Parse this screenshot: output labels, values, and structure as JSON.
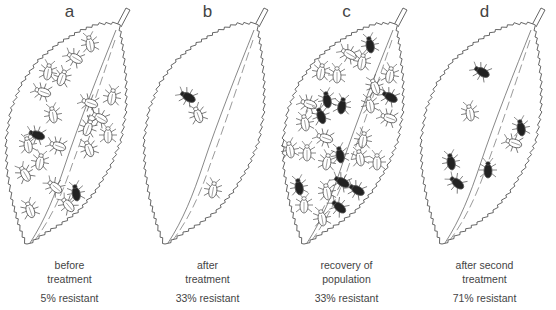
{
  "figure": {
    "colors": {
      "line": "#555555",
      "susceptible_fill": "#ffffff",
      "resistant_fill": "#222222",
      "text": "#444444"
    },
    "legend_semantics": {
      "white_insect": "susceptible",
      "black_insect": "resistant"
    },
    "panels": [
      {
        "letter": "a",
        "caption_line1": "before",
        "caption_line2": "treatment",
        "resistant_label": "5% resistant",
        "resistant_percent": 5,
        "insects": [
          {
            "x": 90,
            "y": 44,
            "r": -10,
            "res": false
          },
          {
            "x": 75,
            "y": 58,
            "r": -60,
            "res": false
          },
          {
            "x": 48,
            "y": 72,
            "r": 10,
            "res": false
          },
          {
            "x": 62,
            "y": 78,
            "r": 20,
            "res": false
          },
          {
            "x": 43,
            "y": 92,
            "r": -70,
            "res": false
          },
          {
            "x": 53,
            "y": 115,
            "r": -10,
            "res": false
          },
          {
            "x": 112,
            "y": 97,
            "r": 10,
            "res": false
          },
          {
            "x": 90,
            "y": 103,
            "r": -70,
            "res": false
          },
          {
            "x": 100,
            "y": 118,
            "r": -60,
            "res": false
          },
          {
            "x": 88,
            "y": 128,
            "r": 20,
            "res": false
          },
          {
            "x": 108,
            "y": 135,
            "r": 0,
            "res": false
          },
          {
            "x": 89,
            "y": 149,
            "r": -20,
            "res": false
          },
          {
            "x": 37,
            "y": 135,
            "r": -70,
            "res": true
          },
          {
            "x": 28,
            "y": 145,
            "r": -10,
            "res": false
          },
          {
            "x": 58,
            "y": 146,
            "r": -70,
            "res": false
          },
          {
            "x": 40,
            "y": 162,
            "r": 10,
            "res": false
          },
          {
            "x": 25,
            "y": 174,
            "r": -30,
            "res": false
          },
          {
            "x": 55,
            "y": 187,
            "r": -50,
            "res": false
          },
          {
            "x": 76,
            "y": 193,
            "r": -10,
            "res": true
          },
          {
            "x": 68,
            "y": 205,
            "r": -40,
            "res": false
          },
          {
            "x": 30,
            "y": 210,
            "r": -20,
            "res": false
          }
        ]
      },
      {
        "letter": "b",
        "caption_line1": "after",
        "caption_line2": "treatment",
        "resistant_label": "33% resistant",
        "resistant_percent": 33,
        "insects": [
          {
            "x": 50,
            "y": 97,
            "r": -60,
            "res": true
          },
          {
            "x": 60,
            "y": 115,
            "r": -20,
            "res": false
          },
          {
            "x": 75,
            "y": 190,
            "r": 10,
            "res": false
          }
        ]
      },
      {
        "letter": "c",
        "caption_line1": "recovery of",
        "caption_line2": "population",
        "resistant_label": "33% resistant",
        "resistant_percent": 33,
        "insects": [
          {
            "x": 93,
            "y": 45,
            "r": -10,
            "res": true
          },
          {
            "x": 72,
            "y": 54,
            "r": -60,
            "res": false
          },
          {
            "x": 85,
            "y": 62,
            "r": 10,
            "res": false
          },
          {
            "x": 44,
            "y": 72,
            "r": 10,
            "res": false
          },
          {
            "x": 60,
            "y": 75,
            "r": 0,
            "res": false
          },
          {
            "x": 113,
            "y": 75,
            "r": 10,
            "res": false
          },
          {
            "x": 98,
            "y": 87,
            "r": -20,
            "res": false
          },
          {
            "x": 50,
            "y": 100,
            "r": -10,
            "res": true
          },
          {
            "x": 65,
            "y": 106,
            "r": 10,
            "res": true
          },
          {
            "x": 32,
            "y": 104,
            "r": -70,
            "res": false
          },
          {
            "x": 113,
            "y": 97,
            "r": -60,
            "res": true
          },
          {
            "x": 93,
            "y": 105,
            "r": -10,
            "res": false
          },
          {
            "x": 44,
            "y": 116,
            "r": -20,
            "res": true
          },
          {
            "x": 28,
            "y": 123,
            "r": -10,
            "res": false
          },
          {
            "x": 112,
            "y": 118,
            "r": -70,
            "res": false
          },
          {
            "x": 48,
            "y": 138,
            "r": -70,
            "res": false
          },
          {
            "x": 86,
            "y": 140,
            "r": 10,
            "res": false
          },
          {
            "x": 13,
            "y": 150,
            "r": -10,
            "res": false
          },
          {
            "x": 30,
            "y": 153,
            "r": 0,
            "res": false
          },
          {
            "x": 63,
            "y": 155,
            "r": -10,
            "res": true
          },
          {
            "x": 83,
            "y": 158,
            "r": -10,
            "res": false
          },
          {
            "x": 100,
            "y": 162,
            "r": 0,
            "res": false
          },
          {
            "x": 50,
            "y": 162,
            "r": 10,
            "res": false
          },
          {
            "x": 22,
            "y": 187,
            "r": -10,
            "res": true
          },
          {
            "x": 65,
            "y": 182,
            "r": -60,
            "res": true
          },
          {
            "x": 50,
            "y": 192,
            "r": -10,
            "res": false
          },
          {
            "x": 80,
            "y": 190,
            "r": -60,
            "res": true
          },
          {
            "x": 27,
            "y": 205,
            "r": 0,
            "res": false
          },
          {
            "x": 62,
            "y": 207,
            "r": -50,
            "res": true
          },
          {
            "x": 45,
            "y": 218,
            "r": -10,
            "res": false
          }
        ]
      },
      {
        "letter": "d",
        "caption_line1": "after second",
        "caption_line2": "treatment",
        "resistant_label": "71% resistant",
        "resistant_percent": 71,
        "insects": [
          {
            "x": 67,
            "y": 72,
            "r": -60,
            "res": true
          },
          {
            "x": 55,
            "y": 113,
            "r": -10,
            "res": false
          },
          {
            "x": 106,
            "y": 128,
            "r": -10,
            "res": true
          },
          {
            "x": 99,
            "y": 143,
            "r": -70,
            "res": false
          },
          {
            "x": 36,
            "y": 162,
            "r": -10,
            "res": true
          },
          {
            "x": 73,
            "y": 170,
            "r": 0,
            "res": true
          },
          {
            "x": 42,
            "y": 183,
            "r": -50,
            "res": true
          }
        ]
      }
    ]
  }
}
